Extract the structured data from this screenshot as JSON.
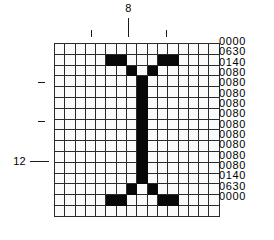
{
  "figure": {
    "glyph": "I",
    "grid_columns": 16,
    "grid_rows": 16,
    "on_color": "#080808",
    "off_color": "#fbfbfb",
    "grid_line_color": "#2b2b2b"
  },
  "top_axis": {
    "label": "8",
    "label_column": 8,
    "ticks": [
      {
        "column": 4,
        "kind": "minor"
      },
      {
        "column": 8,
        "kind": "major"
      },
      {
        "column": 12,
        "kind": "minor"
      }
    ]
  },
  "left_axis": {
    "label": "12",
    "label_row": 12,
    "ticks": [
      {
        "row": 4,
        "kind": "minor"
      },
      {
        "row": 8,
        "kind": "minor"
      },
      {
        "row": 12,
        "kind": "major"
      }
    ]
  },
  "hex_values": [
    "0000",
    "0630",
    "0140",
    "0080",
    "0080",
    "0080",
    "0080",
    "0080",
    "0080",
    "0080",
    "0080",
    "0080",
    "0080",
    "0140",
    "0630",
    "0000"
  ],
  "bitmap": [
    [
      0,
      0,
      0,
      0,
      0,
      0,
      0,
      0,
      0,
      0,
      0,
      0,
      0,
      0,
      0,
      0
    ],
    [
      0,
      0,
      0,
      0,
      0,
      1,
      1,
      0,
      0,
      0,
      1,
      1,
      0,
      0,
      0,
      0
    ],
    [
      0,
      0,
      0,
      0,
      0,
      0,
      0,
      1,
      0,
      1,
      0,
      0,
      0,
      0,
      0,
      0
    ],
    [
      0,
      0,
      0,
      0,
      0,
      0,
      0,
      0,
      1,
      0,
      0,
      0,
      0,
      0,
      0,
      0
    ],
    [
      0,
      0,
      0,
      0,
      0,
      0,
      0,
      0,
      1,
      0,
      0,
      0,
      0,
      0,
      0,
      0
    ],
    [
      0,
      0,
      0,
      0,
      0,
      0,
      0,
      0,
      1,
      0,
      0,
      0,
      0,
      0,
      0,
      0
    ],
    [
      0,
      0,
      0,
      0,
      0,
      0,
      0,
      0,
      1,
      0,
      0,
      0,
      0,
      0,
      0,
      0
    ],
    [
      0,
      0,
      0,
      0,
      0,
      0,
      0,
      0,
      1,
      0,
      0,
      0,
      0,
      0,
      0,
      0
    ],
    [
      0,
      0,
      0,
      0,
      0,
      0,
      0,
      0,
      1,
      0,
      0,
      0,
      0,
      0,
      0,
      0
    ],
    [
      0,
      0,
      0,
      0,
      0,
      0,
      0,
      0,
      1,
      0,
      0,
      0,
      0,
      0,
      0,
      0
    ],
    [
      0,
      0,
      0,
      0,
      0,
      0,
      0,
      0,
      1,
      0,
      0,
      0,
      0,
      0,
      0,
      0
    ],
    [
      0,
      0,
      0,
      0,
      0,
      0,
      0,
      0,
      1,
      0,
      0,
      0,
      0,
      0,
      0,
      0
    ],
    [
      0,
      0,
      0,
      0,
      0,
      0,
      0,
      0,
      1,
      0,
      0,
      0,
      0,
      0,
      0,
      0
    ],
    [
      0,
      0,
      0,
      0,
      0,
      0,
      0,
      1,
      0,
      1,
      0,
      0,
      0,
      0,
      0,
      0
    ],
    [
      0,
      0,
      0,
      0,
      0,
      1,
      1,
      0,
      0,
      0,
      1,
      1,
      0,
      0,
      0,
      0
    ],
    [
      0,
      0,
      0,
      0,
      0,
      0,
      0,
      0,
      0,
      0,
      0,
      0,
      0,
      0,
      0,
      0
    ]
  ]
}
